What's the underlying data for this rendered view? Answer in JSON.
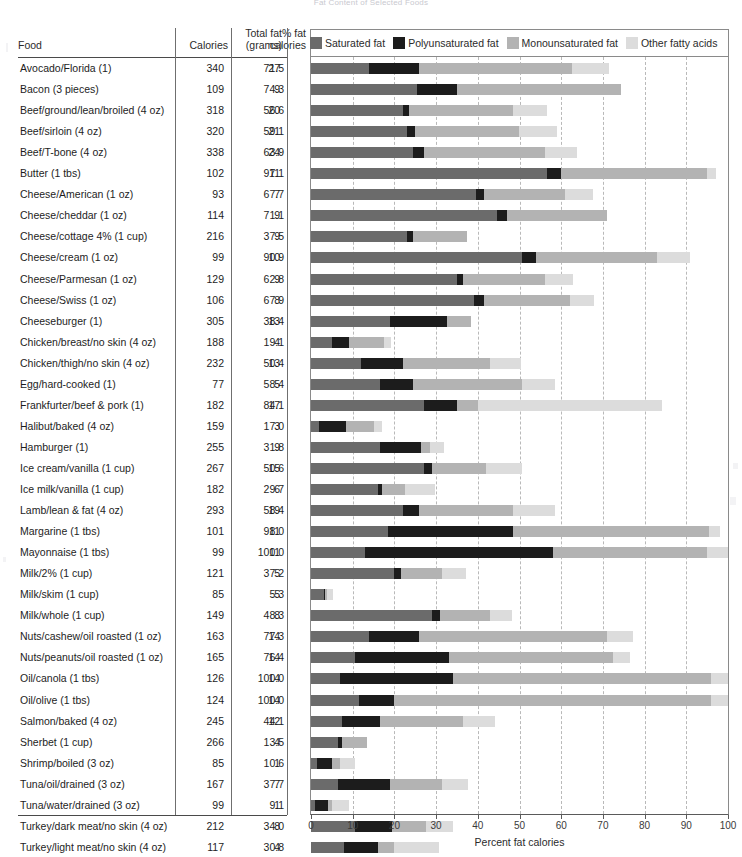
{
  "title": "Fat Content of Selected Foods",
  "axis": {
    "xlabel": "Percent fat calories",
    "ticks": [
      0,
      10,
      20,
      30,
      40,
      50,
      60,
      70,
      80,
      90,
      100
    ],
    "min": 0,
    "max": 100
  },
  "columns": {
    "food": "Food",
    "calories": "Calories",
    "total_fat_line1": "Total fat",
    "total_fat_line2": "(grams)",
    "pct_fat_line1": "% fat",
    "pct_fat_line2": "calories"
  },
  "legend": [
    {
      "label": "Saturated fat",
      "color": "#6b6b6b"
    },
    {
      "label": "Polyunsaturated fat",
      "color": "#1c1c1c"
    },
    {
      "label": "Monounsaturated fat",
      "color": "#b3b3b3"
    },
    {
      "label": "Other fatty acids",
      "color": "#dcdcdc"
    }
  ],
  "colors": {
    "saturated": "#6b6b6b",
    "polyunsaturated": "#1c1c1c",
    "monounsaturated": "#b3b3b3",
    "other": "#dcdcdc",
    "rule": "#4a4a4a",
    "grid": "#b9b9b9",
    "frame": "#8a8a8a"
  },
  "chart_data": {
    "type": "bar",
    "title": "Fat Content of Selected Foods",
    "xlabel": "Percent fat calories",
    "ylabel": "",
    "xlim": [
      0,
      100
    ],
    "grid": true,
    "legend_position": "top",
    "stacked": true,
    "series": [
      {
        "name": "Saturated fat",
        "color": "#6b6b6b"
      },
      {
        "name": "Polyunsaturated fat",
        "color": "#1c1c1c"
      },
      {
        "name": "Monounsaturated fat",
        "color": "#b3b3b3"
      },
      {
        "name": "Other fatty acids",
        "color": "#dcdcdc"
      }
    ],
    "categories": [
      "Avocado/Florida (1)",
      "Bacon (3 pieces)",
      "Beef/ground/lean/broiled (4 oz)",
      "Beef/sirloin (4 oz)",
      "Beef/T-bone (4 oz)",
      "Butter (1 tbs)",
      "Cheese/American (1 oz)",
      "Cheese/cheddar (1 oz)",
      "Cheese/cottage 4% (1 cup)",
      "Cheese/cream (1 oz)",
      "Cheese/Parmesan (1 oz)",
      "Cheese/Swiss (1 oz)",
      "Cheeseburger (1)",
      "Chicken/breast/no skin (4 oz)",
      "Chicken/thigh/no skin (4 oz)",
      "Egg/hard-cooked (1)",
      "Frankfurter/beef & pork (1)",
      "Halibut/baked (4 oz)",
      "Hamburger (1)",
      "Ice cream/vanilla (1 cup)",
      "Ice milk/vanilla (1 cup)",
      "Lamb/lean & fat (4 oz)",
      "Margarine (1 tbs)",
      "Mayonnaise (1 tbs)",
      "Milk/2% (1 cup)",
      "Milk/skim (1 cup)",
      "Milk/whole (1 cup)",
      "Nuts/cashew/oil roasted (1 oz)",
      "Nuts/peanuts/oil roasted (1 oz)",
      "Oil/canola (1 tbs)",
      "Oil/olive (1 tbs)",
      "Salmon/baked (4 oz)",
      "Sherbet (1 cup)",
      "Shrimp/boiled (3 oz)",
      "Tuna/oil/drained (3 oz)",
      "Tuna/water/drained (3 oz)",
      "Turkey/dark meat/no skin (4 oz)",
      "Turkey/light meat/no skin (4 oz)"
    ],
    "rows": [
      {
        "food": "Avocado/Florida (1)",
        "calories": "340",
        "total_fat": "27",
        "pct_fat": "71.5",
        "segments": [
          14.0,
          12.0,
          36.5,
          9.0
        ]
      },
      {
        "food": "Bacon (3 pieces)",
        "calories": "109",
        "total_fat": "9",
        "pct_fat": "74.3",
        "segments": [
          25.5,
          9.5,
          39.3,
          0.0
        ]
      },
      {
        "food": "Beef/ground/lean/broiled (4 oz)",
        "calories": "318",
        "total_fat": "20",
        "pct_fat": "56.6",
        "segments": [
          22.0,
          1.5,
          25.0,
          8.1
        ]
      },
      {
        "food": "Beef/sirloin (4 oz)",
        "calories": "320",
        "total_fat": "21",
        "pct_fat": "59.1",
        "segments": [
          23.0,
          2.0,
          25.0,
          9.1
        ]
      },
      {
        "food": "Beef/T-bone (4 oz)",
        "calories": "338",
        "total_fat": "24",
        "pct_fat": "63.9",
        "segments": [
          24.5,
          2.5,
          29.0,
          7.9
        ]
      },
      {
        "food": "Butter (1 tbs)",
        "calories": "102",
        "total_fat": "11",
        "pct_fat": "97.1",
        "segments": [
          56.5,
          3.5,
          35.0,
          2.1
        ]
      },
      {
        "food": "Cheese/American (1 oz)",
        "calories": "93",
        "total_fat": "7",
        "pct_fat": "67.7",
        "segments": [
          39.5,
          2.0,
          19.5,
          6.7
        ]
      },
      {
        "food": "Cheese/cheddar (1 oz)",
        "calories": "114",
        "total_fat": "9",
        "pct_fat": "71.1",
        "segments": [
          44.5,
          2.5,
          24.1,
          0.0
        ]
      },
      {
        "food": "Cheese/cottage 4% (1 cup)",
        "calories": "216",
        "total_fat": "9",
        "pct_fat": "37.5",
        "segments": [
          23.0,
          1.5,
          13.0,
          0.0
        ]
      },
      {
        "food": "Cheese/cream (1 oz)",
        "calories": "99",
        "total_fat": "10",
        "pct_fat": "90.9",
        "segments": [
          50.5,
          3.5,
          29.0,
          7.9
        ]
      },
      {
        "food": "Cheese/Parmesan (1 oz)",
        "calories": "129",
        "total_fat": "9",
        "pct_fat": "62.8",
        "segments": [
          35.0,
          1.5,
          19.5,
          6.8
        ]
      },
      {
        "food": "Cheese/Swiss (1 oz)",
        "calories": "106",
        "total_fat": "8",
        "pct_fat": "67.9",
        "segments": [
          39.0,
          2.5,
          20.5,
          5.9
        ]
      },
      {
        "food": "Cheeseburger (1)",
        "calories": "305",
        "total_fat": "13",
        "pct_fat": "38.4",
        "segments": [
          19.0,
          13.5,
          5.9,
          0.0
        ]
      },
      {
        "food": "Chicken/breast/no skin (4 oz)",
        "calories": "188",
        "total_fat": "4",
        "pct_fat": "19.1",
        "segments": [
          5.0,
          4.0,
          8.5,
          1.6
        ]
      },
      {
        "food": "Chicken/thigh/no skin (4 oz)",
        "calories": "232",
        "total_fat": "13",
        "pct_fat": "50.4",
        "segments": [
          12.0,
          10.0,
          21.0,
          7.4
        ]
      },
      {
        "food": "Egg/hard-cooked (1)",
        "calories": "77",
        "total_fat": "5",
        "pct_fat": "58.4",
        "segments": [
          16.5,
          8.0,
          26.0,
          7.9
        ]
      },
      {
        "food": "Frankfurter/beef & pork (1)",
        "calories": "182",
        "total_fat": "17",
        "pct_fat": "84.1",
        "segments": [
          27.0,
          8.0,
          5.0,
          44.1
        ]
      },
      {
        "food": "Halibut/baked (4 oz)",
        "calories": "159",
        "total_fat": "3",
        "pct_fat": "17.0",
        "segments": [
          2.0,
          6.5,
          6.5,
          2.0
        ]
      },
      {
        "food": "Hamburger (1)",
        "calories": "255",
        "total_fat": "9",
        "pct_fat": "31.8",
        "segments": [
          16.5,
          10.0,
          2.0,
          3.3
        ]
      },
      {
        "food": "Ice cream/vanilla (1 cup)",
        "calories": "267",
        "total_fat": "15",
        "pct_fat": "50.6",
        "segments": [
          27.0,
          2.0,
          13.0,
          8.6
        ]
      },
      {
        "food": "Ice milk/vanilla (1 cup)",
        "calories": "182",
        "total_fat": "6",
        "pct_fat": "29.7",
        "segments": [
          16.0,
          1.0,
          5.5,
          7.2
        ]
      },
      {
        "food": "Lamb/lean & fat (4 oz)",
        "calories": "293",
        "total_fat": "19",
        "pct_fat": "58.4",
        "segments": [
          22.0,
          4.0,
          22.5,
          9.9
        ]
      },
      {
        "food": "Margarine (1 tbs)",
        "calories": "101",
        "total_fat": "11",
        "pct_fat": "98.0",
        "segments": [
          18.5,
          30.0,
          47.0,
          2.5
        ]
      },
      {
        "food": "Mayonnaise (1 tbs)",
        "calories": "99",
        "total_fat": "11",
        "pct_fat": "100.0",
        "segments": [
          13.0,
          45.0,
          37.0,
          5.0
        ]
      },
      {
        "food": "Milk/2% (1 cup)",
        "calories": "121",
        "total_fat": "5",
        "pct_fat": "37.2",
        "segments": [
          20.0,
          1.5,
          10.0,
          5.7
        ]
      },
      {
        "food": "Milk/skim (1 cup)",
        "calories": "85",
        "total_fat": ".5",
        "pct_fat": "5.3",
        "segments": [
          3.0,
          0.3,
          0.5,
          1.5
        ]
      },
      {
        "food": "Milk/whole (1 cup)",
        "calories": "149",
        "total_fat": "8",
        "pct_fat": "48.3",
        "segments": [
          29.0,
          2.0,
          12.0,
          5.3
        ]
      },
      {
        "food": "Nuts/cashew/oil roasted (1 oz)",
        "calories": "163",
        "total_fat": "14",
        "pct_fat": "77.3",
        "segments": [
          14.0,
          12.0,
          45.0,
          6.3
        ]
      },
      {
        "food": "Nuts/peanuts/oil roasted (1 oz)",
        "calories": "165",
        "total_fat": "14",
        "pct_fat": "76.4",
        "segments": [
          10.5,
          22.5,
          39.5,
          3.9
        ]
      },
      {
        "food": "Oil/canola (1 tbs)",
        "calories": "126",
        "total_fat": "14",
        "pct_fat": "100.0",
        "segments": [
          7.0,
          27.0,
          62.0,
          4.0
        ]
      },
      {
        "food": "Oil/olive (1 tbs)",
        "calories": "124",
        "total_fat": "14",
        "pct_fat": "100.0",
        "segments": [
          11.5,
          8.5,
          76.0,
          4.0
        ]
      },
      {
        "food": "Salmon/baked (4 oz)",
        "calories": "245",
        "total_fat": "12",
        "pct_fat": "44.1",
        "segments": [
          7.5,
          9.0,
          20.0,
          7.6
        ]
      },
      {
        "food": "Sherbet (1 cup)",
        "calories": "266",
        "total_fat": "4",
        "pct_fat": "13.5",
        "segments": [
          6.5,
          1.0,
          6.0,
          0.0
        ]
      },
      {
        "food": "Shrimp/boiled (3 oz)",
        "calories": "85",
        "total_fat": "1",
        "pct_fat": "10.6",
        "segments": [
          1.5,
          3.5,
          2.0,
          3.6
        ]
      },
      {
        "food": "Tuna/oil/drained (3 oz)",
        "calories": "167",
        "total_fat": "7",
        "pct_fat": "37.7",
        "segments": [
          6.5,
          12.5,
          12.5,
          6.2
        ]
      },
      {
        "food": "Tuna/water/drained (3 oz)",
        "calories": "99",
        "total_fat": "1",
        "pct_fat": "9.1",
        "segments": [
          1.0,
          3.0,
          1.0,
          4.1
        ]
      },
      {
        "food": "Turkey/dark meat/no skin (4 oz)",
        "calories": "212",
        "total_fat": "8",
        "pct_fat": "34.0",
        "segments": [
          10.5,
          9.0,
          8.0,
          6.5
        ]
      },
      {
        "food": "Turkey/light meat/no skin (4 oz)",
        "calories": "117",
        "total_fat": "4",
        "pct_fat": "30.8",
        "segments": [
          8.0,
          8.0,
          4.0,
          10.8
        ]
      }
    ]
  }
}
